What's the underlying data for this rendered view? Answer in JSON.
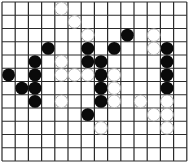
{
  "board": {
    "columns": 14,
    "rows": 12,
    "origin_x": 2,
    "origin_y": 2,
    "cell_size_x": 13.2,
    "cell_size_y": 13.25,
    "stone_radius": 6.4,
    "colors": {
      "background": "#ffffff",
      "grid_line": "#2a2a2a",
      "black_stone": "#0a0a0a",
      "white_stone": "#ffffff",
      "white_stone_outline": "#9a9a9a"
    },
    "black_stones": [
      [
        9,
        2
      ],
      [
        3,
        3
      ],
      [
        6,
        3
      ],
      [
        8,
        3
      ],
      [
        12,
        3
      ],
      [
        2,
        4
      ],
      [
        6,
        4
      ],
      [
        7,
        4
      ],
      [
        12,
        4
      ],
      [
        0,
        5
      ],
      [
        2,
        5
      ],
      [
        7,
        5
      ],
      [
        12,
        5
      ],
      [
        1,
        6
      ],
      [
        2,
        6
      ],
      [
        7,
        6
      ],
      [
        12,
        6
      ],
      [
        2,
        7
      ],
      [
        7,
        7
      ],
      [
        6,
        8
      ]
    ],
    "white_stones": [
      [
        4,
        0
      ],
      [
        5,
        1
      ],
      [
        6,
        2
      ],
      [
        11,
        2
      ],
      [
        11,
        3
      ],
      [
        4,
        4
      ],
      [
        4,
        5
      ],
      [
        5,
        5
      ],
      [
        6,
        5
      ],
      [
        8,
        5
      ],
      [
        8,
        6
      ],
      [
        4,
        7
      ],
      [
        8,
        7
      ],
      [
        10,
        7
      ],
      [
        12,
        7
      ],
      [
        11,
        8
      ],
      [
        12,
        8
      ],
      [
        7,
        9
      ],
      [
        12,
        9
      ]
    ]
  }
}
